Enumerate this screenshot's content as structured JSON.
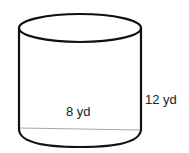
{
  "figure": {
    "shape": "cylinder",
    "labels": {
      "diameter": "8 yd",
      "height": "12 yd"
    },
    "colors": {
      "outline": "#111111",
      "diameter_line": "#a8a8a8",
      "text": "#222222"
    }
  }
}
